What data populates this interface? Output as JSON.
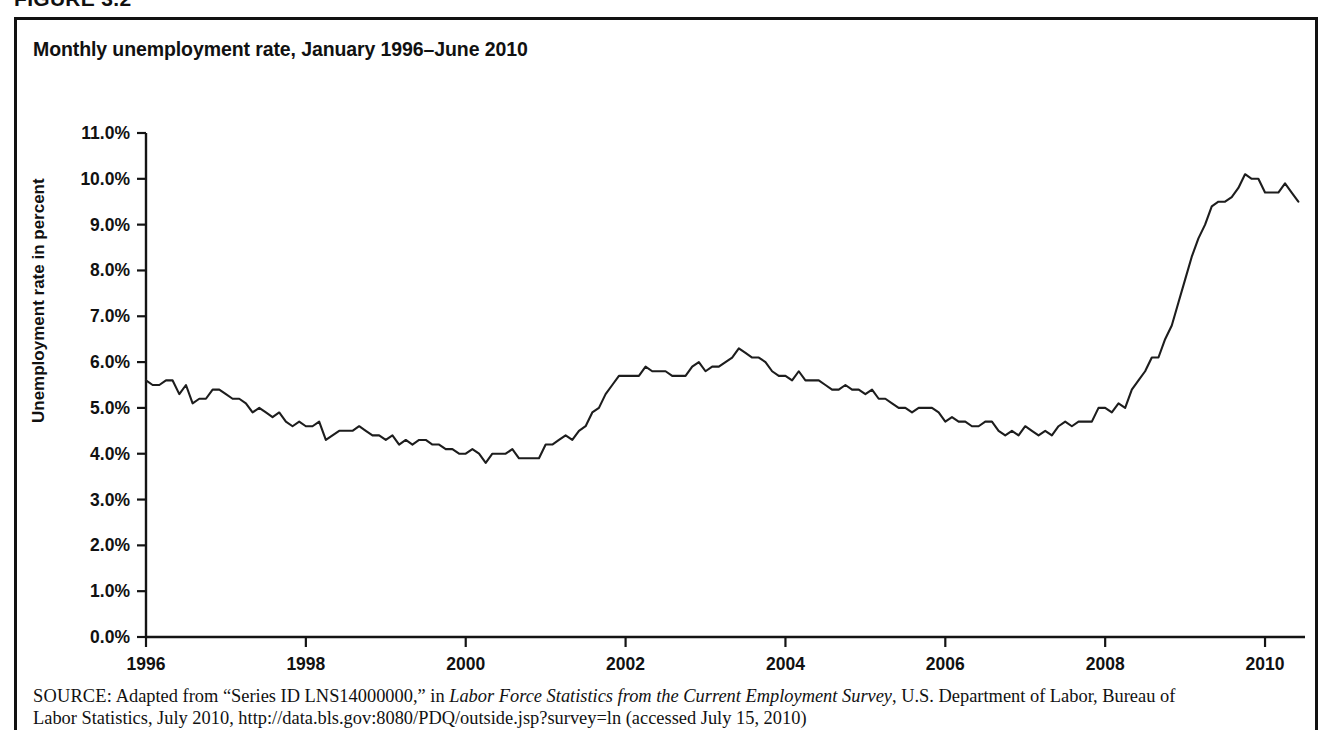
{
  "figure": {
    "number_label": "FIGURE 3.2",
    "title": "Monthly unemployment rate, January 1996–June 2010"
  },
  "source": {
    "label": "SOURCE:",
    "line1_part1": " Adapted from “Series ID LNS14000000,” in ",
    "line1_italic": "Labor Force Statistics from the Current Employment Survey",
    "line1_part2": ", U.S. Department of Labor, Bureau of",
    "line2": "Labor Statistics, July 2010, http://data.bls.gov:8080/PDQ/outside.jsp?survey=ln (accessed July 15, 2010)"
  },
  "chart_data": {
    "type": "line",
    "title": "Monthly unemployment rate, January 1996–June 2010",
    "xlabel": "",
    "ylabel": "Unemployment rate in percent",
    "grid": false,
    "legend": "none",
    "xlim": [
      1996.0,
      2010.5
    ],
    "ylim": [
      0.0,
      11.0
    ],
    "ytick_values": [
      0.0,
      1.0,
      2.0,
      3.0,
      4.0,
      5.0,
      6.0,
      7.0,
      8.0,
      9.0,
      10.0,
      11.0
    ],
    "ytick_labels": [
      "0.0%",
      "1.0%",
      "2.0%",
      "3.0%",
      "4.0%",
      "5.0%",
      "6.0%",
      "7.0%",
      "8.0%",
      "9.0%",
      "10.0%",
      "11.0%"
    ],
    "xtick_values": [
      1996,
      1998,
      2000,
      2002,
      2004,
      2006,
      2008,
      2010
    ],
    "xtick_labels": [
      "1996",
      "1998",
      "2000",
      "2002",
      "2004",
      "2006",
      "2008",
      "2010"
    ],
    "series": [
      {
        "name": "Unemployment rate",
        "color": "#1d1d1d",
        "x_start": 1996.0,
        "x_step": 0.0833333,
        "x_unit": "month",
        "values": [
          5.6,
          5.5,
          5.5,
          5.6,
          5.6,
          5.3,
          5.5,
          5.1,
          5.2,
          5.2,
          5.4,
          5.4,
          5.3,
          5.2,
          5.2,
          5.1,
          4.9,
          5.0,
          4.9,
          4.8,
          4.9,
          4.7,
          4.6,
          4.7,
          4.6,
          4.6,
          4.7,
          4.3,
          4.4,
          4.5,
          4.5,
          4.5,
          4.6,
          4.5,
          4.4,
          4.4,
          4.3,
          4.4,
          4.2,
          4.3,
          4.2,
          4.3,
          4.3,
          4.2,
          4.2,
          4.1,
          4.1,
          4.0,
          4.0,
          4.1,
          4.0,
          3.8,
          4.0,
          4.0,
          4.0,
          4.1,
          3.9,
          3.9,
          3.9,
          3.9,
          4.2,
          4.2,
          4.3,
          4.4,
          4.3,
          4.5,
          4.6,
          4.9,
          5.0,
          5.3,
          5.5,
          5.7,
          5.7,
          5.7,
          5.7,
          5.9,
          5.8,
          5.8,
          5.8,
          5.7,
          5.7,
          5.7,
          5.9,
          6.0,
          5.8,
          5.9,
          5.9,
          6.0,
          6.1,
          6.3,
          6.2,
          6.1,
          6.1,
          6.0,
          5.8,
          5.7,
          5.7,
          5.6,
          5.8,
          5.6,
          5.6,
          5.6,
          5.5,
          5.4,
          5.4,
          5.5,
          5.4,
          5.4,
          5.3,
          5.4,
          5.2,
          5.2,
          5.1,
          5.0,
          5.0,
          4.9,
          5.0,
          5.0,
          5.0,
          4.9,
          4.7,
          4.8,
          4.7,
          4.7,
          4.6,
          4.6,
          4.7,
          4.7,
          4.5,
          4.4,
          4.5,
          4.4,
          4.6,
          4.5,
          4.4,
          4.5,
          4.4,
          4.6,
          4.7,
          4.6,
          4.7,
          4.7,
          4.7,
          5.0,
          5.0,
          4.9,
          5.1,
          5.0,
          5.4,
          5.6,
          5.8,
          6.1,
          6.1,
          6.5,
          6.8,
          7.3,
          7.8,
          8.3,
          8.7,
          9.0,
          9.4,
          9.5,
          9.5,
          9.6,
          9.8,
          10.1,
          10.0,
          10.0,
          9.7,
          9.7,
          9.7,
          9.9,
          9.7,
          9.5
        ]
      }
    ]
  }
}
